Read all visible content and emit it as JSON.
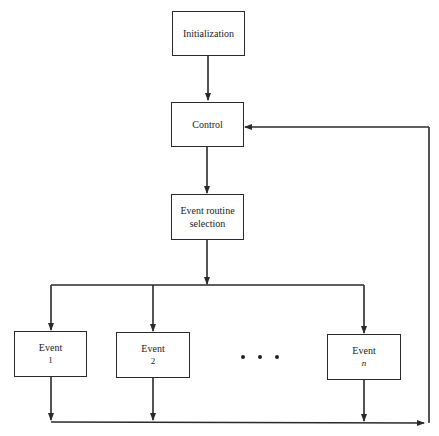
{
  "diagram": {
    "type": "flowchart",
    "nodes": [
      {
        "id": "init",
        "label": "Initialization"
      },
      {
        "id": "control",
        "label": "Control"
      },
      {
        "id": "select",
        "label_line1": "Event routine",
        "label_line2": "selection"
      },
      {
        "id": "event1",
        "label": "Event",
        "index": "1"
      },
      {
        "id": "event2",
        "label": "Event",
        "index": "2"
      },
      {
        "id": "ellipsis",
        "label": "• • •"
      },
      {
        "id": "eventn",
        "label": "Event",
        "index": "n"
      }
    ],
    "edges": [
      {
        "from": "init",
        "to": "control"
      },
      {
        "from": "control",
        "to": "select"
      },
      {
        "from": "select",
        "to": "event1"
      },
      {
        "from": "select",
        "to": "event2"
      },
      {
        "from": "select",
        "to": "eventn"
      },
      {
        "from": "event1",
        "to": "control"
      },
      {
        "from": "event2",
        "to": "control"
      },
      {
        "from": "eventn",
        "to": "control"
      }
    ],
    "line_color": "#2a2a2a"
  }
}
